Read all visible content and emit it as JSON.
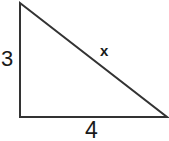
{
  "figure": {
    "kind": "right-triangle-diagram",
    "background_color": "#ffffff",
    "stroke_color": "#333333",
    "stroke_width": 2,
    "text_color": "#1a1a1a",
    "canvas": {
      "width": 169,
      "height": 141
    },
    "vertices": {
      "apex": {
        "x": 20,
        "y": 3
      },
      "bottom_left": {
        "x": 20,
        "y": 117
      },
      "bottom_right": {
        "x": 167,
        "y": 117
      }
    },
    "labels": {
      "vertical_leg": "3",
      "horizontal_leg": "4",
      "hypotenuse": "x"
    }
  }
}
